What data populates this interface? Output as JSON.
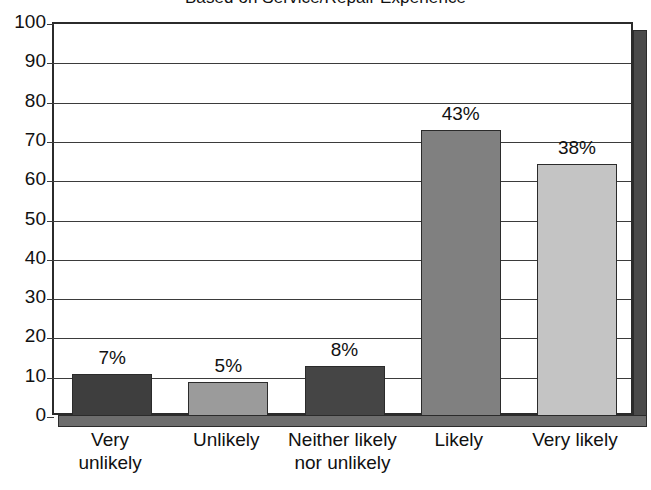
{
  "chart_data": {
    "type": "bar",
    "title": "Based on Service/Repair Experience",
    "xlabel": "",
    "ylabel": "",
    "ylim": [
      0,
      100
    ],
    "ytick_labels": [
      "100",
      "90",
      "80",
      "70",
      "60",
      "50",
      "40",
      "30",
      "20",
      "10",
      "0"
    ],
    "yticks": [
      100,
      90,
      80,
      70,
      60,
      50,
      40,
      30,
      20,
      10,
      0
    ],
    "grid": true,
    "legend": "none",
    "categories": [
      "Very unlikely",
      "Unlikely",
      "Neither likely nor unlikely",
      "Likely",
      "Very likely"
    ],
    "category_lines": [
      [
        "Very",
        "unlikely"
      ],
      [
        "Unlikely",
        ""
      ],
      [
        "Neither likely",
        "nor unlikely"
      ],
      [
        "Likely",
        ""
      ],
      [
        "Very likely",
        ""
      ]
    ],
    "values": [
      11,
      9,
      13,
      73,
      64.5
    ],
    "data_labels": [
      "7%",
      "5%",
      "8%",
      "43%",
      "38%"
    ],
    "bar_colors": [
      "#3e3e3e",
      "#9b9b9b",
      "#454545",
      "#808080",
      "#c4c4c4"
    ],
    "bar_border_color": "#2b2b2b",
    "plot_border_color": "#2b2b2b",
    "gridline_color": "#3b3b3b",
    "side_wall_color": "#4a4a4a",
    "floor_color": "#6d6d6d",
    "background_color": "#ffffff",
    "text_color": "#111111"
  }
}
